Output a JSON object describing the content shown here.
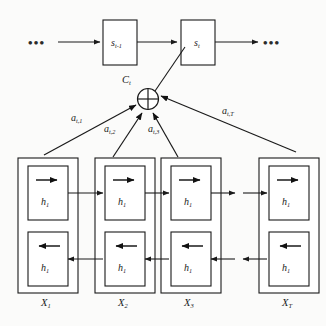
{
  "figure": {
    "type": "diagram",
    "background_color": "#fbfbfa",
    "stroke_color": "#1a1a1a"
  },
  "decoder": {
    "left_ellipsis": "•••",
    "right_ellipsis": "•••",
    "states": [
      {
        "id": "s-prev",
        "base": "s",
        "sub": "t-1"
      },
      {
        "id": "s-curr",
        "base": "s",
        "sub": "t"
      }
    ]
  },
  "context": {
    "operator_glyph": "⊕",
    "label_base": "C",
    "label_sub": "t"
  },
  "attention": {
    "weights": [
      {
        "base": "a",
        "sub": "t,1"
      },
      {
        "base": "a",
        "sub": "t,2"
      },
      {
        "base": "a",
        "sub": "t,3"
      },
      {
        "base": "a",
        "sub": "t,T"
      }
    ]
  },
  "encoder": {
    "forward_arrow": "→",
    "backward_arrow": "←",
    "hidden_base": "h",
    "hidden_sub": "1",
    "timesteps": [
      {
        "input_base": "X",
        "input_sub": "1"
      },
      {
        "input_base": "X",
        "input_sub": "2"
      },
      {
        "input_base": "X",
        "input_sub": "3"
      },
      {
        "input_base": "X",
        "input_sub": "T"
      }
    ]
  }
}
